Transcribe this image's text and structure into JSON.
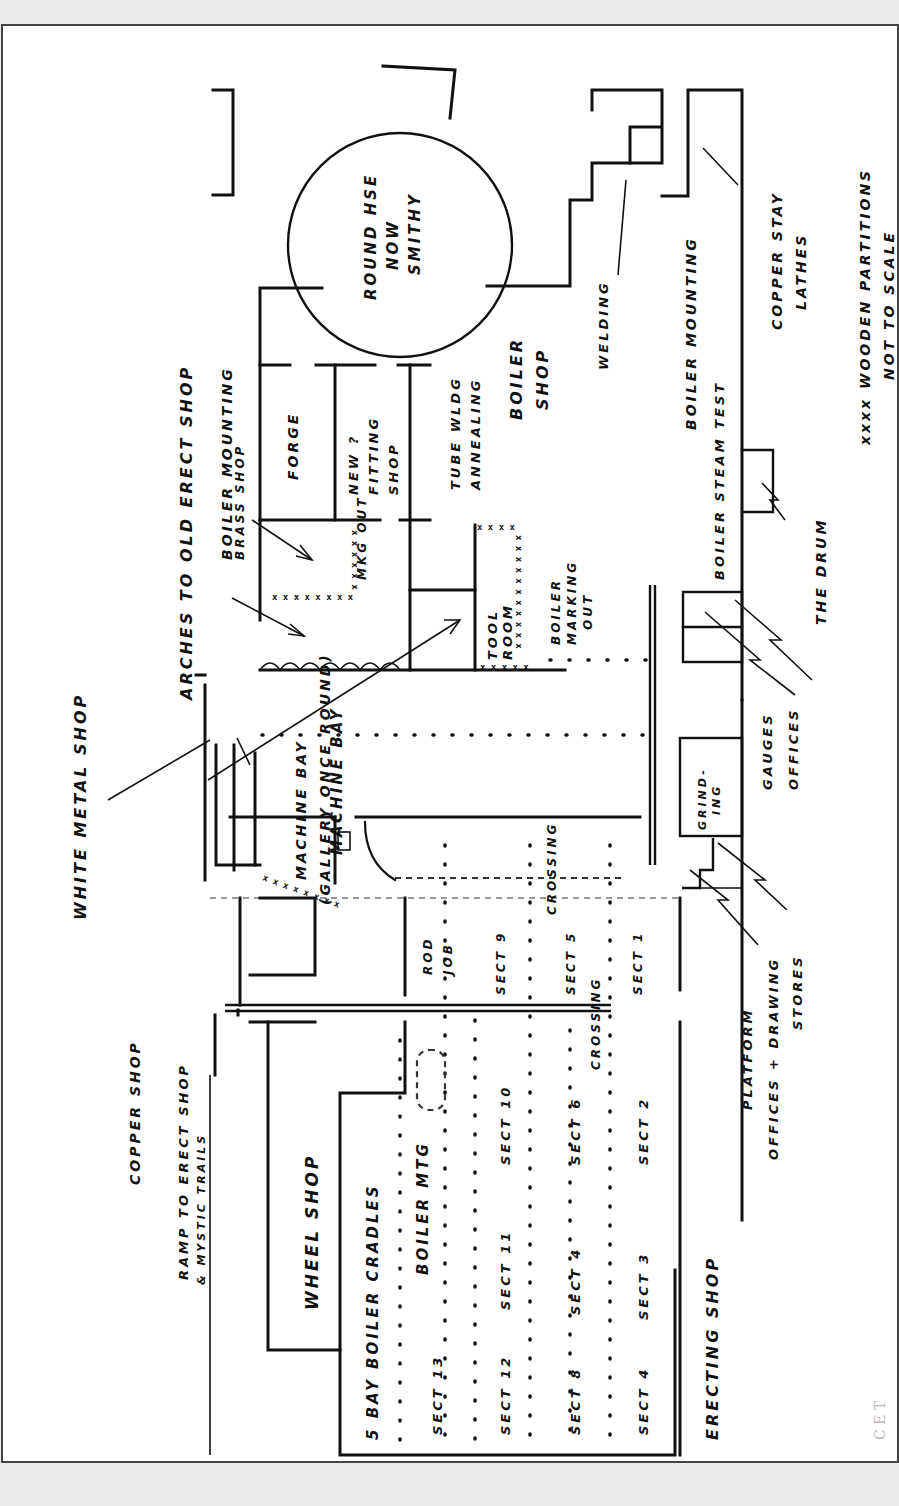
{
  "document": {
    "type": "hand-drawn floor plan (rotated 90° counter-clockwise)",
    "notes": [
      "xxxx WOODEN PARTITIONS",
      "NOT TO SCALE"
    ]
  },
  "areas": {
    "round_house": [
      "ROUND HSE",
      "NOW",
      "SMITHY"
    ],
    "arches": "ARCHES TO OLD ERECT SHOP",
    "boiler_mounting_brass_shop": [
      "BOILER MOUNTING",
      "BRASS SHOP"
    ],
    "forge": "FORGE",
    "fitting_shop": [
      "NEW ?",
      "FITTING",
      "SHOP"
    ],
    "tube_welding": [
      "TUBE WLDG",
      "ANNEALING"
    ],
    "boiler_shop": [
      "BOILER",
      "SHOP"
    ],
    "welding": "WELDING",
    "boiler_mounting_right": "BOILER MOUNTING",
    "copper_stay_lathes": [
      "COPPER STAY",
      "LATHES"
    ],
    "steam_test": "BOILER STEAM TEST",
    "the_drum": "THE DRUM",
    "mkg_out": "MKG OUT",
    "tool_room": [
      "TOOL",
      "ROOM"
    ],
    "boiler_marking_out": [
      "BOILER",
      "MARKING",
      "OUT"
    ],
    "gauges_offices": [
      "GAUGES",
      "OFFICES"
    ],
    "white_metal_shop": "WHITE METAL SHOP",
    "machine_bay_1": "MACHINE BAY",
    "machine_bay_2": [
      "MACHINE BAY",
      "(GALLERY ONCE ROUND)"
    ],
    "grinding": [
      "GRIND-",
      "ING"
    ],
    "crossing_1": "CROSSING",
    "crossing_2": "CROSSING",
    "copper_shop": "COPPER SHOP",
    "ramp": [
      "RAMP TO ERECT SHOP",
      "& MYSTIC TRAILS"
    ],
    "rod_job": [
      "ROD",
      "JOB"
    ],
    "platform": "PLATFORM",
    "offices_drawing_stores": [
      "OFFICES + DRAWING",
      "STORES"
    ],
    "wheel_shop": "WHEEL SHOP",
    "five_bay_boiler_cradles": "5 BAY BOILER CRADLES",
    "boiler_mtg": "BOILER MTG",
    "erecting_shop": "ERECTING SHOP"
  },
  "sections": {
    "row_a": [
      "SECT 13",
      "SECT 12",
      "SECT 8",
      "SECT 4"
    ],
    "row_b": [
      "SECT 11",
      "SECT 7",
      "SECT 3"
    ],
    "row_c": [
      "SECT 10",
      "SECT 6",
      "SECT 2"
    ],
    "row_d": [
      "SECT 9",
      "SECT 5",
      "SECT 1"
    ],
    "all": [
      "SECT 1",
      "SECT 2",
      "SECT 3",
      "SECT 4",
      "SECT 5",
      "SECT 6",
      "SECT 8",
      "SECT 9",
      "SECT 10",
      "SECT 11",
      "SECT 12",
      "SECT 13"
    ]
  },
  "labels_rotated": {
    "sect13": "SECT 13",
    "sect12": "SECT 12",
    "sect8": "SECT 8",
    "sect4": "SECT 4",
    "sect11": "SECT 11",
    "sect7": "SECT 4",
    "sect3": "SECT 3",
    "sect10": "SECT 10",
    "sect6": "SECT 6",
    "sect2": "SECT 2",
    "sect9": "SECT 9",
    "sect5": "SECT 5",
    "sect1": "SECT 1"
  },
  "caption_fragment": "C  E  T"
}
